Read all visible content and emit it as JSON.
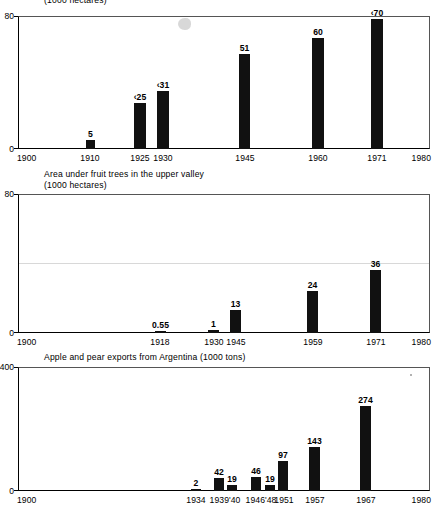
{
  "figure": {
    "background": "#ffffff",
    "bar_color": "#111111",
    "axis_color": "#000000"
  },
  "panels": [
    {
      "id": "panel-1",
      "caption_line1": "",
      "caption_line2": "(1000 hectares)",
      "y_max_label": "80",
      "y_min_label": "0",
      "x_start_label": "1900",
      "x_end_label": "1980"
    },
    {
      "id": "panel-2",
      "caption_line1": "Area under fruit trees in the upper valley",
      "caption_line2": "(1000 hectares)",
      "y_max_label": "80",
      "y_min_label": "0",
      "x_start_label": "1900",
      "x_end_label": "1980"
    },
    {
      "id": "panel-3",
      "caption_line1": "Apple and pear exports from Argentina (1000 tons)",
      "caption_line2": "",
      "y_max_label": "400",
      "y_min_label": "0",
      "x_start_label": "1900",
      "x_end_label": "1980"
    }
  ],
  "chart_data": [
    {
      "type": "bar",
      "title": "(1000 hectares)",
      "xlabel": "",
      "ylabel": "1000 hectares",
      "xlim": [
        1900,
        1980
      ],
      "ylim": [
        0,
        80
      ],
      "grid": false,
      "legend": "none",
      "categories": [
        "1910",
        "1925",
        "1930",
        "1945",
        "1960",
        "1971"
      ],
      "values": [
        5,
        25,
        31,
        51,
        60,
        70
      ],
      "data_labels": [
        "5",
        "c.25",
        "c.31",
        "51",
        "60",
        "c.70"
      ],
      "x_positions": [
        1910,
        1925,
        1930,
        1945,
        1960,
        1971
      ],
      "tick_labels": [
        "1900",
        "1910",
        "1925",
        "1930",
        "1945",
        "1960",
        "1971",
        "1980"
      ]
    },
    {
      "type": "bar",
      "title": "Area under fruit trees in the upper valley (1000 hectares)",
      "xlabel": "",
      "ylabel": "1000 hectares",
      "xlim": [
        1900,
        1980
      ],
      "ylim": [
        0,
        80
      ],
      "grid": false,
      "legend": "none",
      "categories": [
        "1918",
        "1930",
        "1945",
        "1959",
        "1971"
      ],
      "values": [
        0.55,
        1,
        13,
        24,
        36
      ],
      "data_labels": [
        "0.55",
        "1",
        "13",
        "24",
        "36"
      ],
      "x_positions": [
        1918,
        1930,
        1945,
        1959,
        1971
      ],
      "tick_labels": [
        "1900",
        "1918",
        "1930",
        "1945",
        "1959",
        "1971",
        "1980"
      ]
    },
    {
      "type": "bar",
      "title": "Apple and pear exports from Argentina (1000 tons)",
      "xlabel": "",
      "ylabel": "1000 tons",
      "xlim": [
        1900,
        1980
      ],
      "ylim": [
        0,
        400
      ],
      "grid": false,
      "legend": "none",
      "categories": [
        "1934",
        "1939",
        "'40",
        "1946",
        "'48",
        "1951",
        "1957",
        "1967"
      ],
      "values": [
        2,
        42,
        19,
        46,
        19,
        97,
        143,
        274
      ],
      "data_labels": [
        "2",
        "42",
        "19",
        "46",
        "19",
        "97",
        "143",
        "274"
      ],
      "x_positions": [
        1934,
        1939,
        1941.4,
        1946,
        1948.6,
        1951,
        1957,
        1967
      ],
      "tick_labels": [
        "1900",
        "1934",
        "1939'40",
        "1946'48",
        "1951",
        "1957",
        "1967",
        "1980"
      ]
    }
  ],
  "panel1": {
    "bars": [
      {
        "label": "5",
        "x": 86,
        "w": 9,
        "h": 9.3
      },
      {
        "label": "c.25",
        "x": 134,
        "w": 12,
        "h": 46.4
      },
      {
        "label": "c.31",
        "x": 157,
        "w": 12,
        "h": 57.6
      },
      {
        "label": "51",
        "x": 239,
        "w": 11,
        "h": 94.7
      },
      {
        "label": "60",
        "x": 312,
        "w": 12,
        "h": 111.5
      },
      {
        "label": "c.70",
        "x": 371,
        "w": 12,
        "h": 130.0
      }
    ],
    "xticks": [
      {
        "label": "1900",
        "x": 18,
        "align": "left"
      },
      {
        "label": "1910",
        "x": 90,
        "align": "center"
      },
      {
        "label": "1925",
        "x": 140,
        "align": "center"
      },
      {
        "label": "1930",
        "x": 163,
        "align": "center"
      },
      {
        "label": "1945",
        "x": 245,
        "align": "center"
      },
      {
        "label": "1960",
        "x": 318,
        "align": "center"
      },
      {
        "label": "1971",
        "x": 377,
        "align": "center"
      },
      {
        "label": "1980",
        "x": 430,
        "align": "right"
      }
    ]
  },
  "panel2": {
    "bars": [
      {
        "label": "0.55",
        "x": 155,
        "w": 11,
        "h": 2.4
      },
      {
        "label": "1",
        "x": 208,
        "w": 11,
        "h": 3.1
      },
      {
        "label": "13",
        "x": 230,
        "w": 11,
        "h": 22.6
      },
      {
        "label": "24",
        "x": 307,
        "w": 11,
        "h": 41.7
      },
      {
        "label": "36",
        "x": 370,
        "w": 11,
        "h": 62.6
      }
    ],
    "xticks": [
      {
        "label": "1900",
        "x": 18,
        "align": "left"
      },
      {
        "label": "1918",
        "x": 160,
        "align": "center"
      },
      {
        "label": "1930",
        "x": 214,
        "align": "center"
      },
      {
        "label": "1945",
        "x": 236,
        "align": "center"
      },
      {
        "label": "1959",
        "x": 313,
        "align": "center"
      },
      {
        "label": "1971",
        "x": 376,
        "align": "center"
      },
      {
        "label": "1980",
        "x": 430,
        "align": "right"
      }
    ]
  },
  "panel3": {
    "bars": [
      {
        "label": "2",
        "x": 191,
        "w": 10,
        "h": 1.9
      },
      {
        "label": "42",
        "x": 214,
        "w": 10,
        "h": 13.0
      },
      {
        "label": "19",
        "x": 227,
        "w": 10,
        "h": 5.9
      },
      {
        "label": "46",
        "x": 251,
        "w": 10,
        "h": 14.3
      },
      {
        "label": "19",
        "x": 265,
        "w": 10,
        "h": 5.9
      },
      {
        "label": "97",
        "x": 278,
        "w": 10,
        "h": 30.1
      },
      {
        "label": "143",
        "x": 309,
        "w": 11,
        "h": 44.3
      },
      {
        "label": "274",
        "x": 360,
        "w": 11,
        "h": 84.9
      }
    ],
    "xticks": [
      {
        "label": "1900",
        "x": 18,
        "align": "left"
      },
      {
        "label": "1934",
        "x": 196,
        "align": "center"
      },
      {
        "label": "1939'40",
        "x": 225,
        "align": "center"
      },
      {
        "label": "1946'48",
        "x": 261,
        "align": "center"
      },
      {
        "label": "1951",
        "x": 284,
        "align": "center"
      },
      {
        "label": "1957",
        "x": 315,
        "align": "center"
      },
      {
        "label": "1967",
        "x": 366,
        "align": "center"
      },
      {
        "label": "1980",
        "x": 430,
        "align": "right"
      }
    ]
  }
}
